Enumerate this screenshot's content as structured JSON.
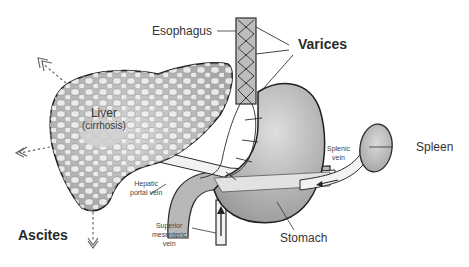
{
  "labels": {
    "esophagus": "Esophagus",
    "varices": "Varices",
    "liver": "Liver",
    "liver_sub": "(cirrhosis)",
    "spleen": "Spleen",
    "splenic_vein_1": "Splenic",
    "splenic_vein_2": "vein",
    "hepatic_portal_vein_1": "Hepatic",
    "hepatic_portal_vein_2": "portal vein",
    "superior_mesenteric_vein_1": "Superior",
    "superior_mesenteric_vein_2": "mesenteric",
    "superior_mesenteric_vein_3": "vein",
    "stomach": "Stomach",
    "ascites": "Ascites"
  },
  "colors": {
    "organ_fill": "#c8c8c8",
    "organ_stroke": "#2b2b2b",
    "vein_fill": "#f2f2f2",
    "nodule_fill": "#f5f5f5",
    "text": "#333333",
    "background": "#ffffff"
  }
}
